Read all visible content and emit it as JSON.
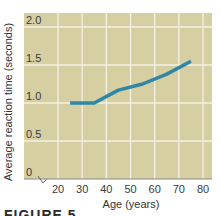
{
  "chart_data": {
    "type": "line",
    "title": "",
    "xlabel": "Age (years)",
    "ylabel": "Average reaction time (seconds)",
    "x_ticks": [
      "20",
      "30",
      "40",
      "50",
      "60",
      "70",
      "80"
    ],
    "y_ticks": [
      "0",
      "0.5",
      "1.0",
      "1.5",
      "2.0"
    ],
    "xlim": [
      20,
      80
    ],
    "ylim": [
      0,
      2.0
    ],
    "grid": true,
    "axis_break": "y-axis break symbol between 0 and 20 on x-axis",
    "series": [
      {
        "name": "Average reaction time",
        "x": [
          25,
          35,
          45,
          55,
          65,
          75
        ],
        "y": [
          1.0,
          1.0,
          1.17,
          1.25,
          1.38,
          1.55
        ]
      }
    ],
    "colors": {
      "plot_background": "#d6cfa2",
      "grid": "#f4f1e4",
      "line": "#2f86a6",
      "axis": "#8a8a8a"
    }
  },
  "caption": "FIGURE 5"
}
